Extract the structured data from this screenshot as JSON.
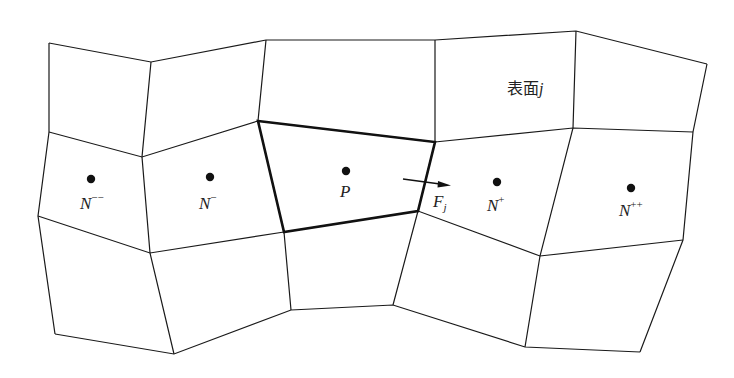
{
  "figure": {
    "face_label": {
      "text": "表面",
      "index": "j"
    },
    "flux_label": {
      "base": "F",
      "sub": "j"
    },
    "nodes": [
      {
        "id": "N--",
        "base": "N",
        "sup": "−−",
        "x": 91,
        "y": 179
      },
      {
        "id": "N-",
        "base": "N",
        "sup": "−",
        "x": 210,
        "y": 177
      },
      {
        "id": "P",
        "base": "P",
        "sup": "",
        "x": 346,
        "y": 171
      },
      {
        "id": "N+",
        "base": "N",
        "sup": "+",
        "x": 497,
        "y": 182
      },
      {
        "id": "N++",
        "base": "N",
        "sup": "++",
        "x": 631,
        "y": 188
      }
    ],
    "colors": {
      "line": "#1a1a1a",
      "dot": "#111111",
      "background": "#ffffff"
    }
  }
}
